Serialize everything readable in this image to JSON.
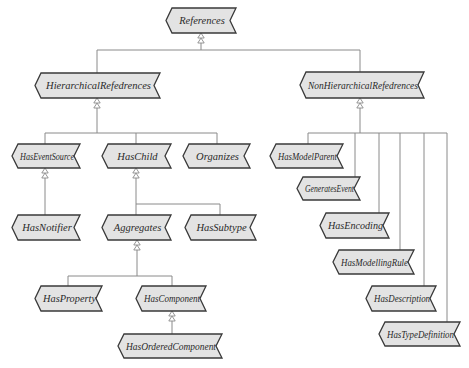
{
  "diagram": {
    "colors": {
      "node_fill": "#e3e3e3",
      "node_border": "#3a3a3a",
      "connector": "#8a8a8a",
      "text": "#2a2a2a",
      "background": "#ffffff"
    },
    "nodes": [
      {
        "id": "references",
        "label": "References",
        "x": 166,
        "y": 8,
        "w": 70,
        "h": 25
      },
      {
        "id": "hierarchical",
        "label": "HierarchicalRefedrences",
        "x": 35,
        "y": 73,
        "w": 125,
        "h": 25
      },
      {
        "id": "nonhierarchical",
        "label": "NonHierarchicalRefedrences",
        "x": 300,
        "y": 72,
        "w": 124,
        "h": 26
      },
      {
        "id": "haseventsource",
        "label": "HasEventSource",
        "x": 12,
        "y": 144,
        "w": 68,
        "h": 24
      },
      {
        "id": "haschild",
        "label": "HasChild",
        "x": 102,
        "y": 144,
        "w": 69,
        "h": 24
      },
      {
        "id": "organizes",
        "label": "Organizes",
        "x": 183,
        "y": 144,
        "w": 67,
        "h": 24
      },
      {
        "id": "hasnotifier",
        "label": "HasNotifier",
        "x": 12,
        "y": 215,
        "w": 68,
        "h": 25
      },
      {
        "id": "aggregates",
        "label": "Aggregates",
        "x": 102,
        "y": 215,
        "w": 69,
        "h": 25
      },
      {
        "id": "hassubtype",
        "label": "HasSubtype",
        "x": 185,
        "y": 215,
        "w": 71,
        "h": 25
      },
      {
        "id": "hasproperty",
        "label": "HasProperty",
        "x": 35,
        "y": 286,
        "w": 67,
        "h": 25
      },
      {
        "id": "hascomponent",
        "label": "HasComponent",
        "x": 136,
        "y": 286,
        "w": 70,
        "h": 25
      },
      {
        "id": "hasorderedcomponent",
        "label": "HasOrderedComponent",
        "x": 118,
        "y": 334,
        "w": 104,
        "h": 24
      },
      {
        "id": "hasmodelparent",
        "label": "HasModelParent",
        "x": 270,
        "y": 144,
        "w": 73,
        "h": 24
      },
      {
        "id": "generatesevent",
        "label": "GeneratesEvent",
        "x": 297,
        "y": 177,
        "w": 63,
        "h": 23
      },
      {
        "id": "hasencoding",
        "label": "HasEncoding",
        "x": 320,
        "y": 213,
        "w": 69,
        "h": 25
      },
      {
        "id": "hasmodellingrule",
        "label": "HasModellingRule",
        "x": 333,
        "y": 250,
        "w": 81,
        "h": 24
      },
      {
        "id": "hasdescription",
        "label": "HasDescription",
        "x": 366,
        "y": 286,
        "w": 70,
        "h": 25
      },
      {
        "id": "hastypedefinition",
        "label": "HasTypeDefinition",
        "x": 379,
        "y": 322,
        "w": 81,
        "h": 24
      }
    ],
    "edges": [
      {
        "from": "hierarchical",
        "to": "references"
      },
      {
        "from": "nonhierarchical",
        "to": "references"
      },
      {
        "from": "haseventsource",
        "to": "hierarchical"
      },
      {
        "from": "haschild",
        "to": "hierarchical"
      },
      {
        "from": "organizes",
        "to": "hierarchical"
      },
      {
        "from": "hasnotifier",
        "to": "haseventsource"
      },
      {
        "from": "aggregates",
        "to": "haschild"
      },
      {
        "from": "hassubtype",
        "to": "haschild"
      },
      {
        "from": "hasproperty",
        "to": "aggregates"
      },
      {
        "from": "hascomponent",
        "to": "aggregates"
      },
      {
        "from": "hasorderedcomponent",
        "to": "hascomponent"
      },
      {
        "from": "hasmodelparent",
        "to": "nonhierarchical"
      },
      {
        "from": "generatesevent",
        "to": "nonhierarchical"
      },
      {
        "from": "hasencoding",
        "to": "nonhierarchical"
      },
      {
        "from": "hasmodellingrule",
        "to": "nonhierarchical"
      },
      {
        "from": "hasdescription",
        "to": "nonhierarchical"
      },
      {
        "from": "hastypedefinition",
        "to": "nonhierarchical"
      }
    ],
    "icons": {
      "inheritance_arrow": "hollow-double-triangle-icon"
    }
  }
}
